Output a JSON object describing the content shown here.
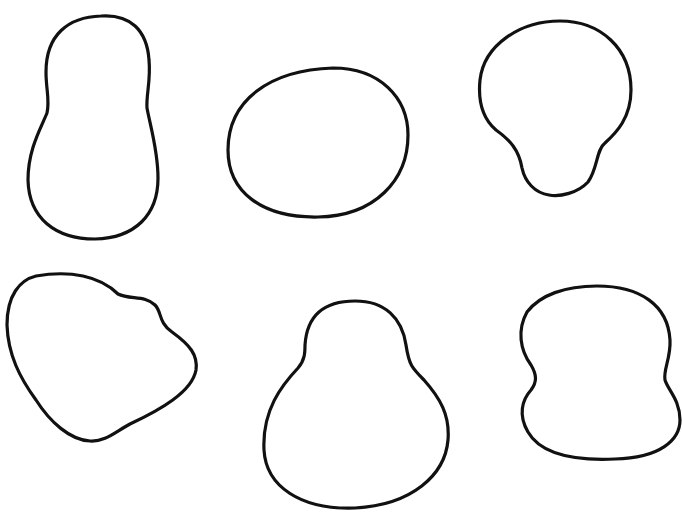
{
  "figure": {
    "background": "#ffffff",
    "stroke_color": "#111111",
    "shapes": [
      {
        "id": "blob-1",
        "name": "peanut-tall-shape",
        "row": 1,
        "col": 1,
        "d": "M101,16 C130,14 147,30 149,60 C151,80 146,95 147,108 C150,125 158,150 158,178 C158,215 135,238 95,239 C55,239 29,218 28,180 C28,150 40,130 47,113 C50,100 46,90 46,72 C46,35 68,17 101,16 Z"
      },
      {
        "id": "blob-2",
        "name": "round-oval-shape",
        "row": 1,
        "col": 2,
        "d": "M333,68 C380,68 408,98 408,135 C408,180 375,216 318,217 C262,218 228,192 228,150 C228,100 270,70 333,68 Z"
      },
      {
        "id": "blob-3",
        "name": "bulb-pear-shape",
        "row": 1,
        "col": 3,
        "d": "M560,21 C600,21 631,48 631,90 C631,118 616,133 605,143 C596,150 598,168 588,182 C578,193 560,197 549,195 C535,193 525,182 522,168 C519,150 510,140 496,130 C482,118 478,100 480,80 C484,45 520,21 560,21 Z"
      },
      {
        "id": "blob-4",
        "name": "lumpy-potato-shape",
        "row": 2,
        "col": 1,
        "d": "M36,276 C70,270 100,276 118,294 C130,300 145,295 155,305 C162,312 158,322 172,332 C190,345 198,355 196,370 C192,392 160,410 130,424 C115,432 105,442 90,441 C70,440 50,422 36,400 C20,378 8,355 7,325 C7,295 20,280 36,276 Z"
      },
      {
        "id": "blob-5",
        "name": "pear-shape",
        "row": 2,
        "col": 3,
        "d": "M355,301 C385,301 402,318 406,345 C409,365 412,368 424,380 C440,398 450,415 448,440 C445,475 412,505 355,508 C300,510 266,486 264,450 C262,410 282,385 298,368 C305,360 305,352 305,345 C307,315 325,301 355,301 Z"
      },
      {
        "id": "blob-6",
        "name": "guitar-body-shape",
        "row": 2,
        "col": 3,
        "d": "M597,286 C640,286 668,305 670,340 C671,358 663,370 665,380 C668,390 680,400 680,420 C680,440 660,458 615,459 C570,461 540,453 528,432 C518,415 522,400 531,390 C537,382 537,375 531,365 C520,350 517,330 527,312 C540,295 565,286 597,286 Z"
      }
    ]
  }
}
